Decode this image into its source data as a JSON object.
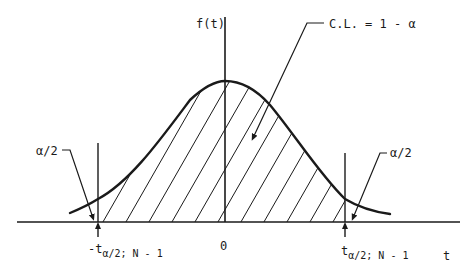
{
  "diagram": {
    "type": "t-distribution confidence interval",
    "y_axis_label": "f(t)",
    "x_axis_label": "t",
    "origin_label": "0",
    "center_callout": "C.L. = 1 - α",
    "left_tail_label": "α/2",
    "right_tail_label": "α/2",
    "left_critical": {
      "prefix": "-t",
      "subscript": "α/2; N - 1"
    },
    "right_critical": {
      "prefix": "t",
      "subscript": "α/2; N - 1"
    },
    "colors": {
      "ink": "#1a1a1a",
      "background": "#ffffff"
    },
    "shaded_region": "between -t and t (hatched)"
  }
}
